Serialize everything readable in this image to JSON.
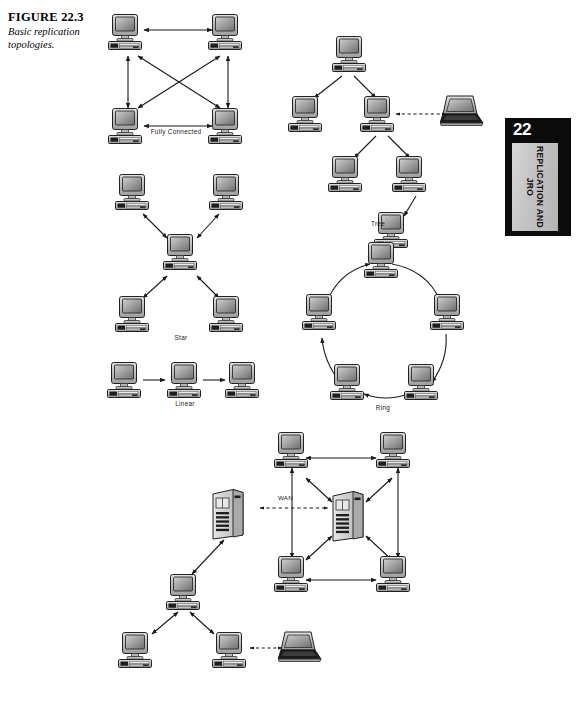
{
  "figure": {
    "number_label": "FIGURE 22.3",
    "caption": "Basic replication topologies."
  },
  "chapter_tab": {
    "number": "22",
    "title": "REPLICATION AND JRO"
  },
  "topologies": [
    {
      "id": "fully-connected",
      "label": "Fully Connected",
      "node_count": 4,
      "link_style": "bidirectional",
      "description": "Four workstations each connected to every other workstation."
    },
    {
      "id": "tree",
      "label": "Tree",
      "node_count": 6,
      "link_style": "directed",
      "description": "Hierarchical parent-child replication with a laptop attached by a dashed link."
    },
    {
      "id": "star",
      "label": "Star",
      "node_count": 5,
      "link_style": "bidirectional",
      "description": "Four workstations radiating from a single central hub."
    },
    {
      "id": "linear",
      "label": "Linear",
      "node_count": 3,
      "link_style": "directed",
      "description": "Three workstations chained left to right."
    },
    {
      "id": "ring",
      "label": "Ring",
      "node_count": 6,
      "link_style": "directed",
      "description": "Six workstations arranged in a closed clockwise loop."
    },
    {
      "id": "hybrid",
      "label": "",
      "node_count": 11,
      "link_style": "mixed",
      "description": "Two server sites joined across a WAN; one site a fully connected cluster, the other a tree with a laptop."
    }
  ],
  "wan": {
    "label": "WAN",
    "style": "dashed-bidirectional"
  },
  "icons": {
    "workstation": "desktop-computer-icon",
    "server": "server-tower-icon",
    "laptop": "laptop-computer-icon"
  },
  "colors": {
    "page_background": "#ffffff",
    "ink": "#1a1a1a",
    "tab_background": "#0b0b0b",
    "tab_plate": "#c8c8c8",
    "device_body": "#b9b9b9",
    "device_outline": "#2a2a2a",
    "screen": "#8d8d8d"
  }
}
